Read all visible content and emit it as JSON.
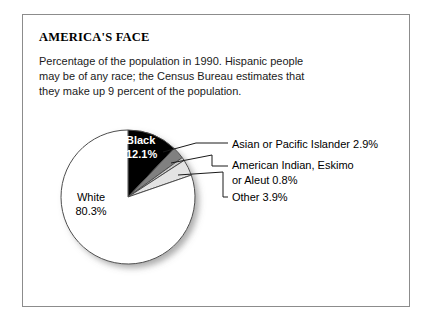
{
  "figure": {
    "title": "AMERICA'S FACE",
    "subtitle_lines": [
      "Percentage of the population in 1990. Hispanic people",
      "may be of any race; the Census Bureau estimates that",
      "they make up 9 percent of the population."
    ],
    "frame_color": "#8c8c8c"
  },
  "labels": {
    "white_name": "White",
    "white_pct": "80.3%",
    "black_name": "Black",
    "black_pct": "12.1%",
    "asian": "Asian or Pacific Islander  2.9%",
    "american_indian_line1": "American Indian, Eskimo",
    "american_indian_line2": "or Aleut  0.8%",
    "other": "Other  3.9%"
  },
  "chart_data": {
    "type": "pie",
    "title": "AMERICA'S FACE",
    "subtitle": "Percentage of the population in 1990. Hispanic people may be of any race; the Census Bureau estimates that they make up 9 percent of the population.",
    "unit": "percent",
    "total": 100.0,
    "start_angle_deg": 0,
    "direction": "clockwise",
    "categories": [
      "Black",
      "Asian or Pacific Islander",
      "American Indian, Eskimo or Aleut",
      "Other",
      "White"
    ],
    "values": [
      12.1,
      2.9,
      0.8,
      3.9,
      80.3
    ],
    "slices": [
      {
        "label": "Black",
        "value": 12.1,
        "display": "12.1%",
        "color": "#000000",
        "label_placement": "inside",
        "text_color": "#ffffff"
      },
      {
        "label": "Asian or Pacific Islander",
        "value": 2.9,
        "display": "2.9%",
        "color": "#808080",
        "label_placement": "callout"
      },
      {
        "label": "American Indian, Eskimo or Aleut",
        "value": 0.8,
        "display": "0.8%",
        "color": "#c9c9c9",
        "label_placement": "callout"
      },
      {
        "label": "Other",
        "value": 3.9,
        "display": "3.9%",
        "color": "#e3e3e3",
        "label_placement": "callout"
      },
      {
        "label": "White",
        "value": 80.3,
        "display": "80.3%",
        "color": "#ffffff",
        "label_placement": "inside",
        "text_color": "#000000"
      }
    ],
    "legend": "none",
    "grid": false,
    "geometry": {
      "cx": 128,
      "cy": 197,
      "r": 67,
      "stroke": "#4d4d4d",
      "shadow": true
    }
  }
}
